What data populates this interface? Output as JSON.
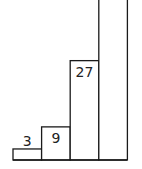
{
  "chart_data": {
    "type": "bar",
    "title": "",
    "xlabel": "",
    "ylabel": "",
    "categories": [
      "1",
      "2",
      "3",
      "4"
    ],
    "values": [
      3,
      9,
      27,
      81
    ],
    "data_labels": [
      "3",
      "9",
      "27",
      ""
    ],
    "label_position": [
      "above",
      "inside-top",
      "inside-top",
      "none"
    ],
    "ylim": [
      0,
      45
    ],
    "grid": false,
    "legend": "none"
  }
}
